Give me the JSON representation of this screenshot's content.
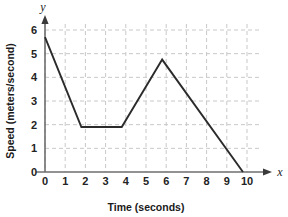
{
  "chart_data": {
    "type": "line",
    "title": "",
    "xlabel": "Time (seconds)",
    "ylabel": "Speed (meters/second)",
    "x_axis_variable": "x",
    "y_axis_variable": "y",
    "xlim": [
      0,
      10
    ],
    "ylim": [
      0,
      6
    ],
    "xticks": [
      "0",
      "1",
      "2",
      "3",
      "4",
      "5",
      "6",
      "7",
      "8",
      "9",
      "10"
    ],
    "yticks": [
      "0",
      "1",
      "2",
      "3",
      "4",
      "5",
      "6"
    ],
    "grid": true,
    "grid_style": "dashed",
    "grid_color": "#c8c8c8",
    "legend": null,
    "line_color": "#2b2b2b",
    "axis_color": "#6e6e6e",
    "series": [
      {
        "name": "Speed",
        "points": [
          {
            "x": 0,
            "y": 5.7
          },
          {
            "x": 1.8,
            "y": 1.9
          },
          {
            "x": 3.8,
            "y": 1.9
          },
          {
            "x": 5.8,
            "y": 4.75
          },
          {
            "x": 9.8,
            "y": 0
          }
        ]
      }
    ]
  }
}
